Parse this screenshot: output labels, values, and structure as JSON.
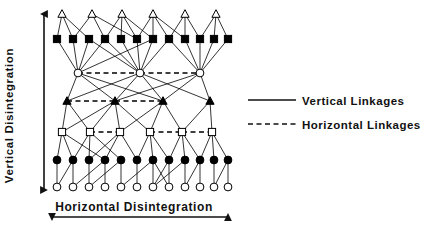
{
  "axes": {
    "vertical": {
      "label": "Vertical Disintegration",
      "arrow": "double-headed-vertical-arrow"
    },
    "horizontal": {
      "label": "Horizontal Disintegration",
      "arrow": "double-headed-horizontal-arrow"
    }
  },
  "legend": {
    "items": [
      {
        "label": "Vertical Linkages",
        "style": "solid",
        "icon": "solid-line-icon"
      },
      {
        "label": "Horizontal Linkages",
        "style": "dashed",
        "icon": "dashed-line-icon"
      }
    ]
  },
  "style": {
    "line_color": "#000000",
    "fill_dark": "#000000",
    "fill_open": "#ffffff",
    "background": "#ffffff",
    "stroke_width": 0.8
  },
  "chart_data": {
    "type": "diagram",
    "title": "",
    "xlabel": "Horizontal Disintegration",
    "ylabel": "Vertical Disintegration",
    "layers": [
      {
        "index": 0,
        "marker": "open-triangle",
        "y": 14,
        "count": 6,
        "x": [
          62,
          92,
          122,
          153,
          185,
          216
        ]
      },
      {
        "index": 1,
        "marker": "filled-square",
        "y": 39,
        "count": 12,
        "x": [
          57,
          73,
          89,
          105,
          121,
          137,
          153,
          169,
          185,
          200,
          214,
          228
        ]
      },
      {
        "index": 2,
        "marker": "open-circle",
        "y": 73,
        "count": 3,
        "x": [
          78,
          140,
          200
        ]
      },
      {
        "index": 3,
        "marker": "filled-triangle",
        "y": 101,
        "count": 4,
        "x": [
          67,
          115,
          163,
          210
        ]
      },
      {
        "index": 4,
        "marker": "open-square",
        "y": 132,
        "count": 6,
        "x": [
          62,
          90,
          120,
          150,
          182,
          212
        ]
      },
      {
        "index": 5,
        "marker": "filled-circle",
        "y": 160,
        "count": 12,
        "x": [
          57,
          73,
          89,
          105,
          121,
          137,
          153,
          169,
          185,
          200,
          214,
          228
        ]
      },
      {
        "index": 6,
        "marker": "open-diamond",
        "y": 187,
        "count": 12,
        "x": [
          57,
          73,
          89,
          105,
          121,
          137,
          153,
          169,
          185,
          200,
          214,
          228
        ]
      }
    ],
    "vertical_linkages": [
      [
        0,
        0,
        1,
        0
      ],
      [
        0,
        0,
        1,
        1
      ],
      [
        0,
        0,
        1,
        2
      ],
      [
        0,
        1,
        1,
        1
      ],
      [
        0,
        1,
        1,
        3
      ],
      [
        0,
        1,
        1,
        5
      ],
      [
        0,
        2,
        1,
        3
      ],
      [
        0,
        2,
        1,
        4
      ],
      [
        0,
        2,
        1,
        5
      ],
      [
        0,
        2,
        1,
        6
      ],
      [
        0,
        3,
        1,
        5
      ],
      [
        0,
        3,
        1,
        6
      ],
      [
        0,
        3,
        1,
        7
      ],
      [
        0,
        3,
        1,
        8
      ],
      [
        0,
        4,
        1,
        8
      ],
      [
        0,
        4,
        1,
        9
      ],
      [
        0,
        4,
        1,
        7
      ],
      [
        0,
        5,
        1,
        10
      ],
      [
        0,
        5,
        1,
        11
      ],
      [
        0,
        5,
        1,
        9
      ],
      [
        1,
        0,
        2,
        0
      ],
      [
        1,
        1,
        2,
        0
      ],
      [
        1,
        2,
        2,
        0
      ],
      [
        1,
        3,
        2,
        0
      ],
      [
        1,
        2,
        2,
        1
      ],
      [
        1,
        4,
        2,
        1
      ],
      [
        1,
        5,
        2,
        1
      ],
      [
        1,
        6,
        2,
        1
      ],
      [
        1,
        7,
        2,
        1
      ],
      [
        1,
        8,
        2,
        2
      ],
      [
        1,
        9,
        2,
        2
      ],
      [
        1,
        10,
        2,
        2
      ],
      [
        1,
        11,
        2,
        2
      ],
      [
        1,
        7,
        2,
        2
      ],
      [
        1,
        3,
        2,
        1
      ],
      [
        1,
        6,
        2,
        0
      ],
      [
        2,
        0,
        3,
        0
      ],
      [
        2,
        0,
        3,
        1
      ],
      [
        2,
        0,
        3,
        2
      ],
      [
        2,
        1,
        3,
        0
      ],
      [
        2,
        1,
        3,
        1
      ],
      [
        2,
        1,
        3,
        2
      ],
      [
        2,
        1,
        3,
        3
      ],
      [
        2,
        2,
        3,
        1
      ],
      [
        2,
        2,
        3,
        2
      ],
      [
        2,
        2,
        3,
        3
      ],
      [
        3,
        0,
        4,
        0
      ],
      [
        3,
        0,
        4,
        1
      ],
      [
        3,
        1,
        4,
        1
      ],
      [
        3,
        1,
        4,
        2
      ],
      [
        3,
        1,
        4,
        3
      ],
      [
        3,
        2,
        4,
        3
      ],
      [
        3,
        2,
        4,
        4
      ],
      [
        3,
        3,
        4,
        4
      ],
      [
        3,
        3,
        4,
        5
      ],
      [
        3,
        1,
        4,
        0
      ],
      [
        3,
        2,
        4,
        2
      ],
      [
        4,
        0,
        5,
        0
      ],
      [
        4,
        0,
        5,
        1
      ],
      [
        4,
        0,
        5,
        3
      ],
      [
        4,
        1,
        5,
        1
      ],
      [
        4,
        1,
        5,
        2
      ],
      [
        4,
        1,
        5,
        4
      ],
      [
        4,
        2,
        5,
        2
      ],
      [
        4,
        2,
        5,
        3
      ],
      [
        4,
        2,
        5,
        5
      ],
      [
        4,
        3,
        5,
        5
      ],
      [
        4,
        3,
        5,
        6
      ],
      [
        4,
        3,
        5,
        7
      ],
      [
        4,
        4,
        5,
        7
      ],
      [
        4,
        4,
        5,
        8
      ],
      [
        4,
        4,
        5,
        9
      ],
      [
        4,
        5,
        5,
        9
      ],
      [
        4,
        5,
        5,
        10
      ],
      [
        4,
        5,
        5,
        11
      ],
      [
        5,
        0,
        6,
        0
      ],
      [
        5,
        1,
        6,
        1
      ],
      [
        5,
        2,
        6,
        2
      ],
      [
        5,
        3,
        6,
        3
      ],
      [
        5,
        4,
        6,
        4
      ],
      [
        5,
        5,
        6,
        5
      ],
      [
        5,
        6,
        6,
        6
      ],
      [
        5,
        7,
        6,
        7
      ],
      [
        5,
        8,
        6,
        8
      ],
      [
        5,
        9,
        6,
        9
      ],
      [
        5,
        10,
        6,
        10
      ],
      [
        5,
        11,
        6,
        11
      ],
      [
        5,
        1,
        6,
        0
      ],
      [
        5,
        3,
        6,
        1
      ],
      [
        5,
        4,
        6,
        2
      ],
      [
        5,
        6,
        6,
        4
      ],
      [
        5,
        6,
        6,
        7
      ],
      [
        5,
        7,
        6,
        6
      ],
      [
        5,
        8,
        6,
        6
      ],
      [
        5,
        9,
        6,
        8
      ],
      [
        5,
        11,
        6,
        10
      ]
    ],
    "horizontal_linkages": [
      [
        2,
        0,
        2,
        1
      ],
      [
        2,
        1,
        2,
        2
      ],
      [
        3,
        0,
        3,
        1
      ],
      [
        3,
        1,
        3,
        2
      ],
      [
        4,
        1,
        4,
        2
      ],
      [
        4,
        3,
        4,
        4
      ],
      [
        4,
        4,
        4,
        5
      ]
    ],
    "legend_position": "right"
  }
}
